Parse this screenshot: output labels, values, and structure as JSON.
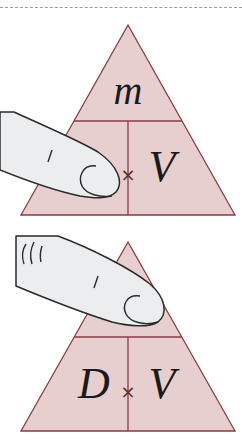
{
  "diagram": {
    "type": "formula-triangle",
    "colors": {
      "fill": "#e8cfcf",
      "line": "#8b3a42",
      "finger_fill": "#ecedee",
      "finger_line": "#2a2a2a"
    },
    "panels": [
      {
        "id": "top",
        "covered": "D",
        "top_label": "m",
        "bottom_left_label": "",
        "bottom_right_label": "V",
        "operator": "×"
      },
      {
        "id": "bottom",
        "covered": "m",
        "top_label": "",
        "bottom_left_label": "D",
        "bottom_right_label": "V",
        "operator": "×"
      }
    ]
  }
}
